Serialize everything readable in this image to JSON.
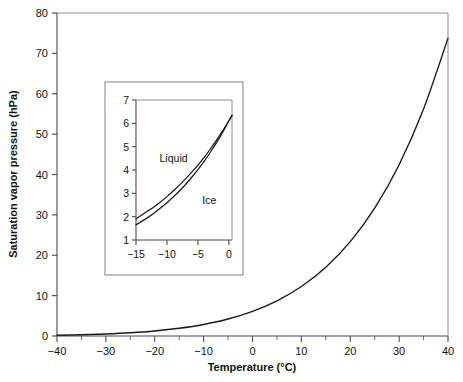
{
  "chart_data": {
    "type": "line",
    "title": "",
    "xlabel": "Temperature (°C)",
    "ylabel": "Saturation vapor pressure (hPa)",
    "xlim": [
      -40,
      40
    ],
    "ylim": [
      0,
      80
    ],
    "grid": false,
    "legend_position": "none",
    "x_ticks": [
      -40,
      -30,
      -20,
      -10,
      0,
      10,
      20,
      30,
      40
    ],
    "x_tick_labels": [
      "−40",
      "−30",
      "−20",
      "−10",
      "0",
      "10",
      "20",
      "30",
      "40"
    ],
    "x_minor_ticks": [
      -35,
      -25,
      -15,
      -5,
      5,
      15,
      25,
      35
    ],
    "y_ticks": [
      0,
      10,
      20,
      30,
      40,
      50,
      60,
      70,
      80
    ],
    "y_tick_labels": [
      "0",
      "10",
      "20",
      "30",
      "40",
      "50",
      "60",
      "70",
      "80"
    ],
    "series": [
      {
        "name": "Saturation vapor pressure over liquid water",
        "color": "#1a1a1a",
        "x": [
          -40,
          -35,
          -30,
          -25,
          -20,
          -15,
          -10,
          -5,
          0,
          5,
          10,
          15,
          20,
          25,
          30,
          35,
          40
        ],
        "values": [
          0.19,
          0.31,
          0.51,
          0.81,
          1.25,
          1.91,
          2.86,
          4.21,
          6.11,
          8.72,
          12.27,
          17.04,
          23.37,
          31.67,
          42.43,
          56.24,
          73.78
        ]
      }
    ],
    "inset": {
      "type": "line",
      "xlabel": "",
      "ylabel": "",
      "xlim": [
        -15,
        0.5
      ],
      "ylim": [
        1,
        7
      ],
      "grid": false,
      "x_ticks": [
        -15,
        -10,
        -5,
        0
      ],
      "x_tick_labels": [
        "−15",
        "−10",
        "−5",
        "0"
      ],
      "y_ticks": [
        1,
        2,
        3,
        4,
        5,
        6,
        7
      ],
      "y_tick_labels": [
        "1",
        "2",
        "3",
        "4",
        "5",
        "6",
        "7"
      ],
      "annotations": [
        {
          "text": "Liquid",
          "x": -11.2,
          "y": 4.35
        },
        {
          "text": "Ice",
          "x": -4.3,
          "y": 2.55
        }
      ],
      "series": [
        {
          "name": "Liquid",
          "color": "#1a1a1a",
          "x": [
            -15,
            -14,
            -13,
            -12,
            -11,
            -10,
            -9,
            -8,
            -7,
            -6,
            -5,
            -4,
            -3,
            -2,
            -1,
            0,
            0.5
          ],
          "values": [
            1.91,
            2.08,
            2.26,
            2.44,
            2.64,
            2.86,
            3.1,
            3.35,
            3.62,
            3.91,
            4.21,
            4.54,
            4.9,
            5.28,
            5.68,
            6.11,
            6.34
          ]
        },
        {
          "name": "Ice",
          "color": "#1a1a1a",
          "x": [
            -15,
            -14,
            -13,
            -12,
            -11,
            -10,
            -9,
            -8,
            -7,
            -6,
            -5,
            -4,
            -3,
            -2,
            -1,
            0,
            0.5
          ],
          "values": [
            1.65,
            1.81,
            1.98,
            2.17,
            2.38,
            2.6,
            2.84,
            3.1,
            3.38,
            3.69,
            4.02,
            4.37,
            4.76,
            5.17,
            5.62,
            6.11,
            6.34
          ]
        }
      ]
    }
  },
  "figure": {
    "xlabel": "Temperature (°C)",
    "ylabel": "Saturation vapor pressure (hPa)",
    "inset_label_liquid": "Liquid",
    "inset_label_ice": "Ice"
  }
}
